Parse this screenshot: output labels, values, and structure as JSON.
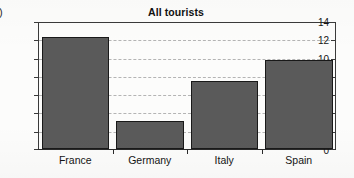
{
  "panel": {
    "label": "a)"
  },
  "chart_data": {
    "type": "bar",
    "title": "All tourists",
    "xlabel": "",
    "ylabel": "",
    "categories": [
      "France",
      "Germany",
      "Italy",
      "Spain"
    ],
    "values": [
      12.4,
      3.2,
      7.55,
      9.9
    ],
    "ylim": [
      0,
      14
    ],
    "ytick_labels": [
      "0",
      "2",
      "4",
      "6",
      "8",
      "10",
      "12",
      "14"
    ],
    "ytick_values": [
      0,
      2,
      4,
      6,
      8,
      10,
      12,
      14
    ],
    "grid": "horizontal-dashed",
    "legend": "none",
    "bar_fill_color": "#5a5a5a",
    "bar_edge_color": "#191919",
    "axis_color": "#2a2a2a",
    "gridline_color": "#b4b4b4",
    "background_color": "#fcfcfb"
  }
}
